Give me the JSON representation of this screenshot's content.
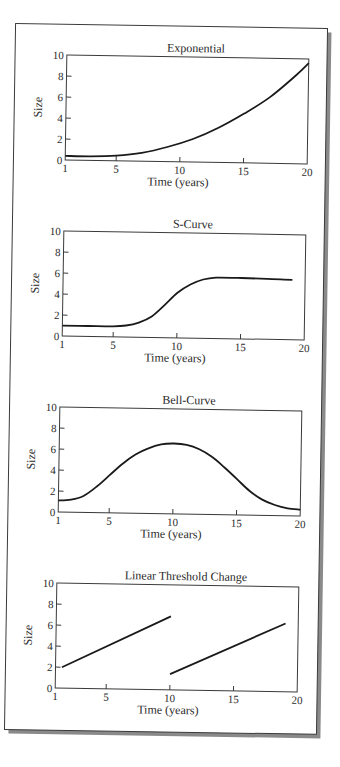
{
  "figure": {
    "colors": {
      "line": "#1a1a1a",
      "axis": "#3a3a3a",
      "frame": "#3a3a3a",
      "shadow": "#8a8a8a",
      "paper": "#ffffff"
    }
  },
  "chart_data": [
    {
      "type": "line",
      "title": "Exponential",
      "xlabel": "Time (years)",
      "ylabel": "Size",
      "xlim": [
        1,
        20
      ],
      "ylim": [
        0,
        10
      ],
      "xticks": [
        1,
        5,
        10,
        15,
        20
      ],
      "yticks": [
        0,
        2,
        4,
        6,
        8,
        10
      ],
      "grid": false,
      "series": [
        {
          "name": "Exponential",
          "x": [
            1,
            3,
            5,
            7,
            9,
            11,
            13,
            15,
            17,
            19,
            20
          ],
          "y": [
            0.4,
            0.4,
            0.5,
            0.8,
            1.4,
            2.2,
            3.3,
            4.7,
            6.3,
            8.4,
            9.6
          ]
        }
      ]
    },
    {
      "type": "line",
      "title": "S-Curve",
      "xlabel": "Time (years)",
      "ylabel": "Size",
      "xlim": [
        1,
        20
      ],
      "ylim": [
        0,
        10
      ],
      "xticks": [
        1,
        5,
        10,
        15,
        20
      ],
      "yticks": [
        0,
        2,
        4,
        6,
        8,
        10
      ],
      "grid": false,
      "series": [
        {
          "name": "S-Curve",
          "x": [
            1,
            3,
            5,
            6,
            7,
            8,
            9,
            10,
            11,
            12,
            13,
            15,
            17,
            19
          ],
          "y": [
            1.0,
            1.0,
            1.0,
            1.1,
            1.4,
            2.0,
            3.1,
            4.3,
            5.1,
            5.6,
            5.8,
            5.8,
            5.75,
            5.7
          ]
        }
      ]
    },
    {
      "type": "line",
      "title": "Bell-Curve",
      "xlabel": "Time (years)",
      "ylabel": "Size",
      "xlim": [
        1,
        20
      ],
      "ylim": [
        0,
        10
      ],
      "xticks": [
        1,
        5,
        10,
        15,
        20
      ],
      "yticks": [
        0,
        2,
        4,
        6,
        8,
        10
      ],
      "grid": false,
      "series": [
        {
          "name": "Bell-Curve",
          "x": [
            1,
            2,
            3,
            4,
            5,
            6,
            7,
            8,
            9,
            10,
            11,
            12,
            13,
            14,
            15,
            16,
            17,
            18,
            19,
            20
          ],
          "y": [
            1.1,
            1.2,
            1.6,
            2.5,
            3.6,
            4.7,
            5.6,
            6.2,
            6.6,
            6.7,
            6.6,
            6.2,
            5.5,
            4.5,
            3.4,
            2.3,
            1.5,
            1.0,
            0.7,
            0.6
          ]
        }
      ]
    },
    {
      "type": "line",
      "title": "Linear Threshold Change",
      "xlabel": "Time (years)",
      "ylabel": "Size",
      "xlim": [
        1,
        20
      ],
      "ylim": [
        0,
        10
      ],
      "xticks": [
        1,
        5,
        10,
        15,
        20
      ],
      "yticks": [
        0,
        2,
        4,
        6,
        8,
        10
      ],
      "grid": false,
      "series": [
        {
          "name": "Segment 1",
          "x": [
            1.5,
            10
          ],
          "y": [
            2.0,
            7.0
          ]
        },
        {
          "name": "Segment 2",
          "x": [
            10,
            19
          ],
          "y": [
            1.5,
            6.5
          ]
        }
      ]
    }
  ]
}
